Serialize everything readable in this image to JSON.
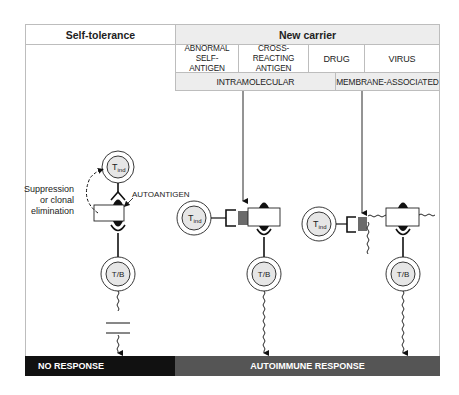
{
  "header": {
    "left_title": "Self-tolerance",
    "right_title": "New carrier"
  },
  "carrier_types": [
    {
      "label": "ABNORMAL SELF-ANTIGEN"
    },
    {
      "label": "CROSS-REACTING ANTIGEN"
    },
    {
      "label": "DRUG"
    },
    {
      "label": "VIRUS"
    }
  ],
  "carrier_groups": [
    {
      "label": "INTRAMOLECULAR"
    },
    {
      "label": "MEMBRANE-ASSOCIATED"
    }
  ],
  "left_panel": {
    "suppression_label_1": "Suppression",
    "suppression_label_2": "or clonal",
    "suppression_label_3": "elimination",
    "autoantigen_label": "AUTOANTIGEN",
    "tind_label": "T",
    "tind_sub": "ind",
    "tb_label": "T/B"
  },
  "cells": {
    "tind_label": "T",
    "tind_sub": "ind",
    "tb_label": "T/B"
  },
  "outcomes": {
    "left": "NO RESPONSE",
    "right": "AUTOIMMUNE RESPONSE"
  },
  "colors": {
    "no_response_bar": "#111111",
    "autoimmune_bar": "#555555",
    "header_shade": "#ededed",
    "cell_fill": "#e6e6e6",
    "carrier_block": "#6b6b6b"
  }
}
